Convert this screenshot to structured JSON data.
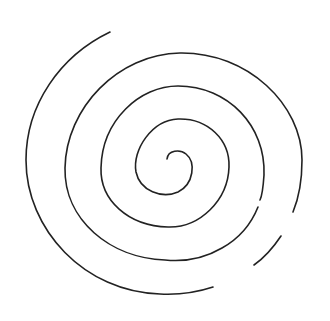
{
  "figure": {
    "type": "spiral-line-drawing",
    "stroke_color": "#222222",
    "background_color": "#ffffff",
    "segments": [
      {
        "name": "inner-spiral",
        "description": "continuous inner coils"
      },
      {
        "name": "outer-right-fragment",
        "description": "short arc lower right"
      },
      {
        "name": "outer-arc",
        "description": "outermost arc left side"
      }
    ]
  }
}
